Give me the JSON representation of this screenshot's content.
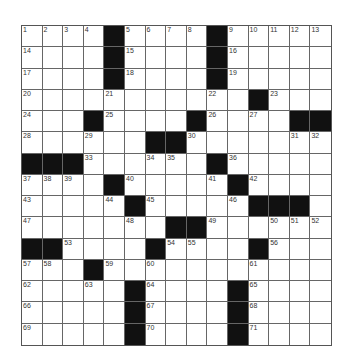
{
  "puzzle": {
    "rows": 15,
    "cols": 15,
    "colors": {
      "black": "#111111",
      "white": "#ffffff",
      "line": "#666666"
    },
    "layout": [
      "....#....#.....",
      "....#....#.....",
      "....#....#.....",
      "...........#...",
      "...#....#....##",
      "......##.......",
      "###......#.....",
      "....#.....#....",
      ".....#.....###.",
      ".......##......",
      "##....#....#...",
      "...#...........",
      ".....#....#....",
      ".....#....#....",
      ".....#....#...."
    ],
    "numbers": [
      {
        "r": 0,
        "c": 0,
        "n": "1"
      },
      {
        "r": 0,
        "c": 1,
        "n": "2"
      },
      {
        "r": 0,
        "c": 2,
        "n": "3"
      },
      {
        "r": 0,
        "c": 3,
        "n": "4"
      },
      {
        "r": 0,
        "c": 5,
        "n": "5"
      },
      {
        "r": 0,
        "c": 6,
        "n": "6"
      },
      {
        "r": 0,
        "c": 7,
        "n": "7"
      },
      {
        "r": 0,
        "c": 8,
        "n": "8"
      },
      {
        "r": 0,
        "c": 10,
        "n": "9"
      },
      {
        "r": 0,
        "c": 11,
        "n": "10"
      },
      {
        "r": 0,
        "c": 12,
        "n": "11"
      },
      {
        "r": 0,
        "c": 13,
        "n": "12"
      },
      {
        "r": 0,
        "c": 14,
        "n": "13"
      },
      {
        "r": 1,
        "c": 0,
        "n": "14"
      },
      {
        "r": 1,
        "c": 5,
        "n": "15"
      },
      {
        "r": 1,
        "c": 10,
        "n": "16"
      },
      {
        "r": 2,
        "c": 0,
        "n": "17"
      },
      {
        "r": 2,
        "c": 5,
        "n": "18"
      },
      {
        "r": 2,
        "c": 10,
        "n": "19"
      },
      {
        "r": 3,
        "c": 0,
        "n": "20"
      },
      {
        "r": 3,
        "c": 4,
        "n": "21"
      },
      {
        "r": 3,
        "c": 9,
        "n": "22"
      },
      {
        "r": 3,
        "c": 12,
        "n": "23"
      },
      {
        "r": 4,
        "c": 0,
        "n": "24"
      },
      {
        "r": 4,
        "c": 4,
        "n": "25"
      },
      {
        "r": 4,
        "c": 9,
        "n": "26"
      },
      {
        "r": 4,
        "c": 11,
        "n": "27"
      },
      {
        "r": 5,
        "c": 0,
        "n": "28"
      },
      {
        "r": 5,
        "c": 3,
        "n": "29"
      },
      {
        "r": 5,
        "c": 8,
        "n": "30"
      },
      {
        "r": 5,
        "c": 13,
        "n": "31"
      },
      {
        "r": 5,
        "c": 14,
        "n": "32"
      },
      {
        "r": 6,
        "c": 3,
        "n": "33"
      },
      {
        "r": 6,
        "c": 6,
        "n": "34"
      },
      {
        "r": 6,
        "c": 7,
        "n": "35"
      },
      {
        "r": 6,
        "c": 10,
        "n": "36"
      },
      {
        "r": 7,
        "c": 0,
        "n": "37"
      },
      {
        "r": 7,
        "c": 1,
        "n": "38"
      },
      {
        "r": 7,
        "c": 2,
        "n": "39"
      },
      {
        "r": 7,
        "c": 5,
        "n": "40"
      },
      {
        "r": 7,
        "c": 9,
        "n": "41"
      },
      {
        "r": 7,
        "c": 11,
        "n": "42"
      },
      {
        "r": 8,
        "c": 0,
        "n": "43"
      },
      {
        "r": 8,
        "c": 4,
        "n": "44"
      },
      {
        "r": 8,
        "c": 6,
        "n": "45"
      },
      {
        "r": 8,
        "c": 10,
        "n": "46"
      },
      {
        "r": 9,
        "c": 0,
        "n": "47"
      },
      {
        "r": 9,
        "c": 5,
        "n": "48"
      },
      {
        "r": 9,
        "c": 9,
        "n": "49"
      },
      {
        "r": 9,
        "c": 12,
        "n": "50"
      },
      {
        "r": 9,
        "c": 13,
        "n": "51"
      },
      {
        "r": 9,
        "c": 14,
        "n": "52"
      },
      {
        "r": 10,
        "c": 2,
        "n": "53"
      },
      {
        "r": 10,
        "c": 7,
        "n": "54"
      },
      {
        "r": 10,
        "c": 8,
        "n": "55"
      },
      {
        "r": 10,
        "c": 12,
        "n": "56"
      },
      {
        "r": 11,
        "c": 0,
        "n": "57"
      },
      {
        "r": 11,
        "c": 1,
        "n": "58"
      },
      {
        "r": 11,
        "c": 4,
        "n": "59"
      },
      {
        "r": 11,
        "c": 6,
        "n": "60"
      },
      {
        "r": 11,
        "c": 11,
        "n": "61"
      },
      {
        "r": 12,
        "c": 0,
        "n": "62"
      },
      {
        "r": 12,
        "c": 3,
        "n": "63"
      },
      {
        "r": 12,
        "c": 6,
        "n": "64"
      },
      {
        "r": 12,
        "c": 11,
        "n": "65"
      },
      {
        "r": 13,
        "c": 0,
        "n": "66"
      },
      {
        "r": 13,
        "c": 6,
        "n": "67"
      },
      {
        "r": 13,
        "c": 11,
        "n": "68"
      },
      {
        "r": 14,
        "c": 0,
        "n": "69"
      },
      {
        "r": 14,
        "c": 6,
        "n": "70"
      },
      {
        "r": 14,
        "c": 11,
        "n": "71"
      }
    ]
  }
}
